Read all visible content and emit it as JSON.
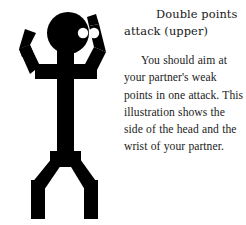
{
  "page": {
    "background_color": "#ffffff",
    "width": 246,
    "height": 225
  },
  "illustration": {
    "name": "double-points-attack-stick-figure",
    "description": "Black silhouette stick figure with both arms raised and bent, legs spread apart, with two white circular target markers indicating the side of the head and the wrist",
    "silhouette_color": "#000000",
    "marker_color": "#ffffff",
    "markers": [
      {
        "label": "side-of-head",
        "cx": 83,
        "cy": 33,
        "r": 5.2
      },
      {
        "label": "wrist",
        "cx": 94,
        "cy": 33,
        "r": 5.2
      }
    ]
  },
  "text": {
    "title_line_1": "Double points",
    "title_line_2": "attack (upper)",
    "body": "You should aim at your partner's weak points in one attack. This illustration shows the side of the head and the wrist of your partner."
  }
}
